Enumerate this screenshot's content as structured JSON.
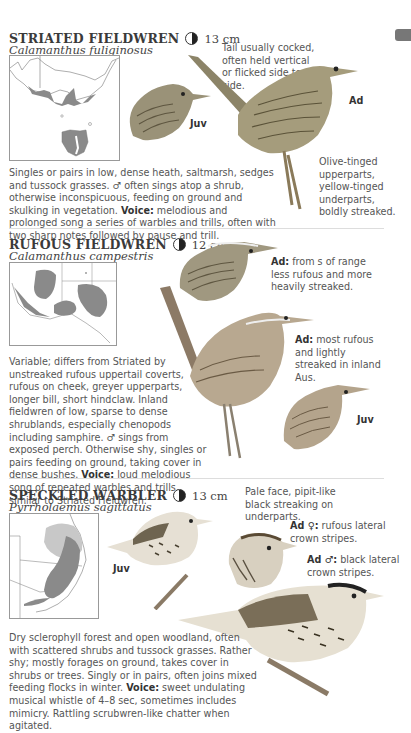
{
  "page_tab": {
    "color": "#777777"
  },
  "species": [
    {
      "common_name": "STRIATED FIELDWREN",
      "size": "13 cm",
      "scientific_name": "Calamanthus fuliginosus",
      "status_icon": "half-filled-circle-icon",
      "map": {
        "range_color": "#8a8a8a",
        "region": "SE Australia and Tasmania"
      },
      "notes": {
        "tail": "Tail usually cocked, often held vertical or flicked side to side.",
        "plumage": "Olive-tinged upperparts, yellow-tinged underparts, boldly streaked."
      },
      "labels": {
        "juv": "Juv",
        "ad": "Ad"
      },
      "description": "Singles or pairs in low, dense heath, saltmarsh, sedges and tussock grasses. ♂ often sings atop a shrub, otherwise inconspicuous, feeding on ground and skulking in vegetation.",
      "voice_label": "Voice:",
      "voice": "melodious and prolonged song a series of warbles and trills, often with two sharp notes followed by pause and trill."
    },
    {
      "common_name": "RUFOUS FIELDWREN",
      "size": "12 cm",
      "scientific_name": "Calamanthus campestris",
      "status_icon": "half-filled-circle-icon",
      "map": {
        "range_color": "#8a8a8a",
        "region": "Southern and western Australia"
      },
      "notes": {
        "ad1_label": "Ad:",
        "ad1": "from s of range less rufous and more heavily streaked.",
        "ad2_label": "Ad:",
        "ad2": "most rufous and lightly streaked in inland Aus."
      },
      "labels": {
        "juv": "Juv"
      },
      "description": "Variable; differs from Striated by unstreaked rufous uppertail coverts, rufous on cheek, greyer upperparts, longer bill, short hindclaw. Inland fieldwren of low, sparse to dense shrublands, especially chenopods including samphire. ♂ sings from exposed perch. Otherwise shy, singles or pairs feeding on ground, taking cover in dense bushes.",
      "voice_label": "Voice:",
      "voice": "loud melodious song of repeated warbles and trills, similar to Striated Fieldwren."
    },
    {
      "common_name": "SPECKLED WARBLER",
      "size": "13 cm",
      "scientific_name": "Pyrrholaemus sagittatus",
      "status_icon": "half-filled-circle-icon",
      "map": {
        "range_color": "#8a8a8a",
        "range_light_color": "#c8c8c8",
        "region": "Eastern Australia"
      },
      "notes": {
        "face": "Pale face, pipit-like black streaking on underparts.",
        "female_label": "Ad ♀:",
        "female": "rufous lateral crown stripes.",
        "male_label": "Ad ♂:",
        "male": "black lateral crown stripes."
      },
      "labels": {
        "juv": "Juv"
      },
      "description": "Dry sclerophyll forest and open woodland, often with scattered shrubs and tussock grasses. Rather shy; mostly forages on ground, takes cover in shrubs or trees. Singly or in pairs, often joins mixed feeding flocks in winter.",
      "voice_label": "Voice:",
      "voice": "sweet undulating musical whistle of 4–8 sec, sometimes includes mimicry. Rattling scrubwren-like chatter when agitated."
    }
  ]
}
